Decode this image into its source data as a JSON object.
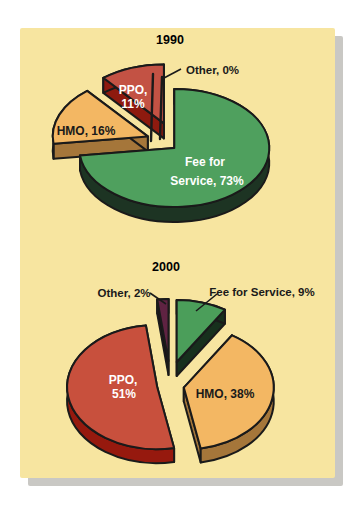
{
  "page": {
    "background_color": "#ffffff",
    "card_color": "#f7e5a0",
    "card_shadow_color": "#c9c8c4",
    "outline_color": "#1a1a1a",
    "label_black": "#1a1a1a",
    "label_white": "#ffffff"
  },
  "chart_data": [
    {
      "type": "pie",
      "style": "3d-exploded",
      "title": "1990",
      "legend_position": "none",
      "slices": [
        {
          "label": "Fee for Service",
          "value_pct": 73,
          "data_label": "Fee for Service, 73%",
          "label_lines": [
            "Fee for",
            "Service, 73%"
          ],
          "color": "#4fa05e",
          "side_color": "#1d3423",
          "text_color": "#ffffff"
        },
        {
          "label": "HMO",
          "value_pct": 16,
          "data_label": "HMO, 16%",
          "label_lines": [
            "HMO, 16%"
          ],
          "color": "#f3b763",
          "side_color": "#a5763a",
          "text_color": "#1a1a1a"
        },
        {
          "label": "PPO",
          "value_pct": 11,
          "data_label": "PPO, 11%",
          "label_lines": [
            "PPO,",
            "11%"
          ],
          "color": "#c35244",
          "side_color": "#8e1a0f",
          "text_color": "#ffffff"
        },
        {
          "label": "Other",
          "value_pct": 0,
          "data_label": "Other, 0%",
          "label_lines": [
            "Other, 0%"
          ],
          "color": "#f7e5a0",
          "side_color": "#1a1a1a",
          "text_color": "#1a1a1a"
        }
      ]
    },
    {
      "type": "pie",
      "style": "3d-exploded",
      "title": "2000",
      "legend_position": "none",
      "slices": [
        {
          "label": "Fee for Service",
          "value_pct": 9,
          "data_label": "Fee for Service, 9%",
          "label_lines": [
            "Fee for Service, 9%"
          ],
          "color": "#4b9e5a",
          "side_color": "#17301d",
          "text_color": "#1a1a1a"
        },
        {
          "label": "HMO",
          "value_pct": 38,
          "data_label": "HMO, 38%",
          "label_lines": [
            "HMO, 38%"
          ],
          "color": "#f3b763",
          "side_color": "#a5763a",
          "text_color": "#1a1a1a"
        },
        {
          "label": "PPO",
          "value_pct": 51,
          "data_label": "PPO, 51%",
          "label_lines": [
            "PPO,",
            "51%"
          ],
          "color": "#c8503d",
          "side_color": "#96190e",
          "text_color": "#ffffff"
        },
        {
          "label": "Other",
          "value_pct": 2,
          "data_label": "Other, 2%",
          "label_lines": [
            "Other, 2%"
          ],
          "color": "#5f2342",
          "side_color": "#200b16",
          "text_color": "#1a1a1a"
        }
      ]
    }
  ]
}
